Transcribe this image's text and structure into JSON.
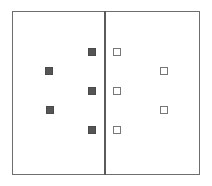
{
  "diagram": {
    "colors": {
      "filled": "#555555",
      "open_border": "#777777",
      "frame": "#6e6e6e"
    },
    "left_panel": {
      "marker": "filled-square",
      "points": [
        {
          "x": 92,
          "y": 52
        },
        {
          "x": 49,
          "y": 71
        },
        {
          "x": 92,
          "y": 91
        },
        {
          "x": 50,
          "y": 110
        },
        {
          "x": 92,
          "y": 130
        }
      ]
    },
    "right_panel": {
      "marker": "open-square",
      "points": [
        {
          "x": 117,
          "y": 52
        },
        {
          "x": 164,
          "y": 71
        },
        {
          "x": 117,
          "y": 91
        },
        {
          "x": 164,
          "y": 110
        },
        {
          "x": 117,
          "y": 130
        }
      ]
    }
  }
}
